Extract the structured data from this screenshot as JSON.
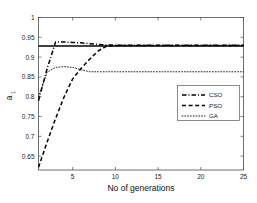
{
  "chart_data": {
    "type": "line",
    "title": "",
    "xlabel": "No of generations",
    "ylabel": "a",
    "ylabel_sub": "1",
    "xlim": [
      1,
      25
    ],
    "ylim": [
      0.615,
      1.0
    ],
    "grid": false,
    "legend_position": "center-right",
    "xticks": [
      5,
      10,
      15,
      20,
      25
    ],
    "xtick_labels": [
      "5",
      "10",
      "15",
      "20",
      "25"
    ],
    "yticks": [
      0.65,
      0.7,
      0.75,
      0.8,
      0.85,
      0.9,
      0.95,
      1
    ],
    "ytick_labels": [
      "0.65",
      "0.7",
      "0.75",
      "0.8",
      "0.85",
      "0.9",
      "0.95",
      "1"
    ],
    "series": [
      {
        "name": "CSO",
        "style": "dash-dot",
        "color": "#000000",
        "x": [
          1,
          2,
          3,
          4,
          5,
          6,
          7,
          8,
          9,
          10,
          12,
          15,
          18,
          20,
          22,
          25
        ],
        "values": [
          0.79,
          0.87,
          0.938,
          0.938,
          0.937,
          0.936,
          0.934,
          0.932,
          0.931,
          0.93,
          0.93,
          0.93,
          0.93,
          0.93,
          0.93,
          0.93
        ]
      },
      {
        "name": "PSO",
        "style": "dashed",
        "color": "#000000",
        "x": [
          1,
          2,
          3,
          4,
          5,
          6,
          7,
          8,
          9,
          10,
          12,
          15,
          18,
          20,
          22,
          25
        ],
        "values": [
          0.622,
          0.685,
          0.745,
          0.8,
          0.845,
          0.872,
          0.895,
          0.916,
          0.928,
          0.929,
          0.929,
          0.929,
          0.929,
          0.929,
          0.929,
          0.929
        ]
      },
      {
        "name": "GA",
        "style": "dotted",
        "color": "#000000",
        "x": [
          1,
          2,
          3,
          4,
          5,
          6,
          7,
          8,
          9,
          10,
          12,
          15,
          18,
          20,
          22,
          25
        ],
        "values": [
          0.8,
          0.862,
          0.874,
          0.876,
          0.874,
          0.868,
          0.863,
          0.863,
          0.863,
          0.863,
          0.863,
          0.863,
          0.863,
          0.863,
          0.863,
          0.863
        ]
      },
      {
        "name": "reference",
        "style": "solid",
        "color": "#000000",
        "x": [
          1,
          25
        ],
        "values": [
          0.928,
          0.928
        ]
      }
    ],
    "legend_entries": [
      {
        "label": "CSO",
        "style": "dash-dot"
      },
      {
        "label": "PSO",
        "style": "dashed"
      },
      {
        "label": "GA",
        "style": "dotted"
      }
    ]
  }
}
